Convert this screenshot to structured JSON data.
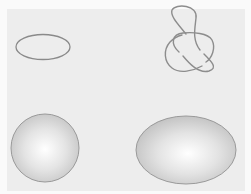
{
  "figure": {
    "background": "#ededed",
    "stroke_color": "#8a8a8a",
    "shapes": [
      {
        "name": "ellipse-curve",
        "kind": "curve",
        "cx": 43,
        "cy": 47,
        "rx": 27,
        "ry": 13
      },
      {
        "name": "trefoil-knot",
        "kind": "knot",
        "cx": 189,
        "cy": 42
      },
      {
        "name": "sphere",
        "kind": "surface",
        "cx": 45,
        "cy": 148,
        "r": 34
      },
      {
        "name": "ellipsoid",
        "kind": "surface",
        "cx": 186,
        "cy": 150,
        "rx": 50,
        "ry": 34
      }
    ]
  }
}
